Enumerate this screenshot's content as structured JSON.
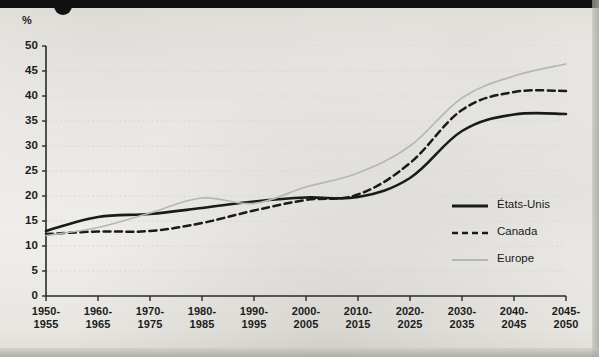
{
  "page": {
    "unit_label": "%",
    "accent_dark": "#111111",
    "series_us_color": "#1a1a1a",
    "series_canada_color": "#1a1a1a",
    "series_europe_color": "#b6b6b6",
    "grid_color": "#d8d6d2",
    "axis_color": "#2a2a2a"
  },
  "chart_data": {
    "type": "line",
    "title": "",
    "subtitle": "",
    "xlabel": "",
    "ylabel": "%",
    "ylim": [
      0,
      50
    ],
    "ytick_step": 5,
    "grid": true,
    "legend_position": "right-middle",
    "yticks": [
      "0",
      "5",
      "10",
      "15",
      "20",
      "25",
      "30",
      "35",
      "40",
      "45",
      "50"
    ],
    "categories": [
      "1950-1955",
      "1960-1965",
      "1970-1975",
      "1980-1985",
      "1990-1995",
      "2000-2005",
      "2010-2015",
      "2020-2025",
      "2030-2035",
      "2040-2045",
      "2045-2050"
    ],
    "xtick_labels_top": [
      "1950-",
      "1960-",
      "1970-",
      "1980-",
      "1990-",
      "2000-",
      "2010-",
      "2020-",
      "2030-",
      "2040-",
      "2045-"
    ],
    "xtick_labels_bottom": [
      "1955",
      "1965",
      "1975",
      "1985",
      "1995",
      "2005",
      "2015",
      "2025",
      "2035",
      "2045",
      "2050"
    ],
    "series": [
      {
        "name": "États-Unis",
        "style": "solid",
        "color": "#1a1a1a",
        "values": [
          13.0,
          15.8,
          16.4,
          17.6,
          18.9,
          19.7,
          19.8,
          23.6,
          33.0,
          36.3,
          36.4
        ]
      },
      {
        "name": "Canada",
        "style": "dashed",
        "color": "#1a1a1a",
        "values": [
          12.4,
          12.9,
          13.0,
          14.6,
          17.1,
          19.2,
          20.3,
          26.6,
          37.2,
          40.8,
          41.0
        ]
      },
      {
        "name": "Europe",
        "style": "solid-light",
        "color": "#b6b6b6",
        "values": [
          12.1,
          13.7,
          16.6,
          19.6,
          18.5,
          21.8,
          24.6,
          30.0,
          39.6,
          44.0,
          46.4
        ]
      }
    ]
  },
  "legend": {
    "items": [
      {
        "label": "États-Unis",
        "style": "solid",
        "color": "#1a1a1a"
      },
      {
        "label": "Canada",
        "style": "dashed",
        "color": "#1a1a1a"
      },
      {
        "label": "Europe",
        "style": "solid-light",
        "color": "#b6b6b6"
      }
    ]
  }
}
